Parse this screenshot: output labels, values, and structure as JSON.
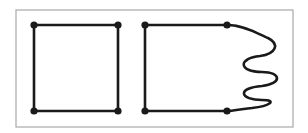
{
  "figure": {
    "colors": {
      "background": "#ffffff",
      "frame": "#a8a8a8",
      "stroke": "#1a1a1a"
    },
    "frame": {
      "x": 16,
      "y": 10,
      "width": 277,
      "height": 117
    },
    "left_square": {
      "vertices": [
        [
          34,
          25
        ],
        [
          118,
          25
        ],
        [
          118,
          111
        ],
        [
          34,
          111
        ]
      ]
    },
    "right_shape": {
      "vertices": [
        [
          145,
          25
        ],
        [
          227,
          25
        ],
        [
          227,
          111
        ],
        [
          145,
          111
        ]
      ],
      "wavy_side_path": "M227,25 C245,25 260,35 268,38 C280,44 276,54 260,56 C238,58 238,72 262,72 C282,72 282,84 262,86 C236,88 240,100 262,100 C278,100 270,106 252,108 C240,109 234,111 227,111"
    }
  }
}
